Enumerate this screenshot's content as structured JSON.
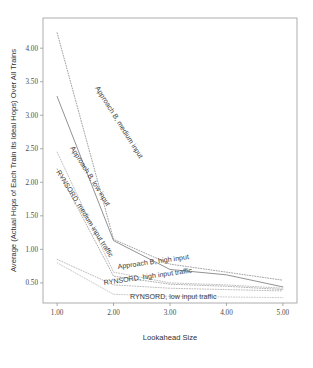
{
  "chart_data": {
    "type": "line",
    "title": "",
    "xlabel": "Lookahead Size",
    "ylabel": "Average (Actual Hops of Each Train  Its Ideal Hops) Over All Trains",
    "x": [
      1.0,
      2.0,
      3.0,
      4.0,
      5.0
    ],
    "xlim": [
      0.75,
      5.25
    ],
    "ylim": [
      0.2,
      4.45
    ],
    "xticks": [
      "1.00",
      "2.00",
      "3.00",
      "4.00",
      "5.00"
    ],
    "yticks": [
      "0.50",
      "1.00",
      "1.50",
      "2.00",
      "2.50",
      "3.00",
      "3.50",
      "4.00"
    ],
    "ytick_values": [
      0.5,
      1.0,
      1.5,
      2.0,
      2.5,
      3.0,
      3.5,
      4.0
    ],
    "grid": false,
    "legend_position": "inline-annotations",
    "series": [
      {
        "name": "Approach B, medium input",
        "values": [
          4.23,
          1.15,
          0.78,
          0.66,
          0.54
        ],
        "color": "#8d8d8d",
        "style": "dotted",
        "label_x": 95,
        "label_y": 88,
        "label_rotate": 58
      },
      {
        "name": "Approach B, low input",
        "values": [
          3.28,
          1.13,
          0.7,
          0.62,
          0.44
        ],
        "color": "#7e7e7e",
        "style": "solid",
        "label_x": 70,
        "label_y": 148,
        "label_rotate": 58
      },
      {
        "name": "RYNSORD, medium input traffic",
        "values": [
          2.45,
          0.66,
          0.5,
          0.47,
          0.42
        ],
        "color": "#b0b0b0",
        "style": "dotted",
        "label_x": 56,
        "label_y": 172,
        "label_rotate": 58
      },
      {
        "name": "Approach B, high input",
        "values": [
          2.2,
          0.6,
          0.48,
          0.45,
          0.4
        ],
        "color": "#9c9c9c",
        "style": "dotted",
        "label_x": 118,
        "label_y": 269,
        "label_rotate": -8
      },
      {
        "name": "RYNSORD, high input traffic",
        "values": [
          0.85,
          0.47,
          0.42,
          0.4,
          0.38
        ],
        "color": "#ababab",
        "style": "dotted",
        "label_x": 104,
        "label_y": 285,
        "label_rotate": -8
      },
      {
        "name": "RYNSORD, low input traffic",
        "values": [
          0.8,
          0.33,
          0.3,
          0.29,
          0.28
        ],
        "color": "#bbbbbb",
        "style": "dotted",
        "label_x": 130,
        "label_y": 299,
        "label_rotate": 0
      }
    ]
  }
}
